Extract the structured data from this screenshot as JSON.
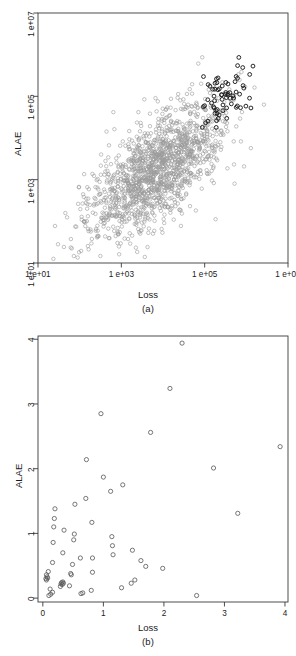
{
  "figure": {
    "panels": [
      {
        "id": "a",
        "caption": "(a)",
        "xlabel": "Loss",
        "ylabel": "ALAE",
        "xticks": [
          "1 e+01",
          "1 e+03",
          "1 e+05",
          "1 e+07"
        ],
        "yticks": [
          "1 e+01",
          "1 e+03",
          "1 e+05",
          "1 e+07"
        ]
      },
      {
        "id": "b",
        "caption": "(b)",
        "xlabel": "Loss",
        "ylabel": "ALAE",
        "xticks": [
          "0",
          "1",
          "2",
          "3",
          "4"
        ],
        "yticks": [
          "0",
          "1",
          "2",
          "3",
          "4"
        ]
      }
    ]
  },
  "colors": {
    "frame": "#3a3a3a",
    "point_light": "#9a9a9a",
    "point_dark": "#1c1c1c",
    "text": "#1a1a1a",
    "background": "#ffffff"
  },
  "chart_data": [
    {
      "type": "scatter",
      "title": "(a)",
      "xlabel": "Loss",
      "ylabel": "ALAE",
      "xscale": "log10",
      "yscale": "log10",
      "xlim": [
        10,
        10000000
      ],
      "ylim": [
        10,
        10000000
      ],
      "xtick_values": [
        10,
        1000,
        100000,
        10000000
      ],
      "xtick_labels": [
        "1 e+01",
        "1 e+03",
        "1 e+05",
        "1 e+07"
      ],
      "ytick_values": [
        10,
        1000,
        100000,
        10000000
      ],
      "ytick_labels": [
        "1 e+01",
        "1 e+03",
        "1 e+05",
        "1 e+07"
      ],
      "grid": false,
      "legend": "none",
      "marker": "open-circle",
      "notes": "Large bulk sample drawn in light gray; an upper-right subset of extreme joint observations drawn in black.",
      "series": [
        {
          "name": "bulk",
          "color": "#9a9a9a",
          "n_points": 1466,
          "log10_x_mean": 3.85,
          "log10_x_sd": 0.82,
          "log10_y_mean": 3.22,
          "log10_y_sd": 0.78,
          "log10_corr": 0.63
        },
        {
          "name": "extreme-subset",
          "color": "#1c1c1c",
          "n_points": 68,
          "log10_x_mean": 5.42,
          "log10_x_sd": 0.36,
          "log10_y_mean": 4.94,
          "log10_y_sd": 0.38,
          "log10_corr": 0.55
        }
      ]
    },
    {
      "type": "scatter",
      "title": "(b)",
      "xlabel": "Loss",
      "ylabel": "ALAE",
      "xscale": "linear",
      "yscale": "linear",
      "xlim": [
        -0.08,
        4.05
      ],
      "ylim": [
        -0.06,
        4.05
      ],
      "xtick_values": [
        0,
        1,
        2,
        3,
        4
      ],
      "xtick_labels": [
        "0",
        "1",
        "2",
        "3",
        "4"
      ],
      "ytick_values": [
        0,
        1,
        2,
        3,
        4
      ],
      "ytick_labels": [
        "0",
        "1",
        "2",
        "3",
        "4"
      ],
      "grid": false,
      "legend": "none",
      "marker": "open-circle",
      "marker_color": "#555555",
      "points": [
        [
          2.3,
          3.94
        ],
        [
          2.1,
          3.24
        ],
        [
          0.96,
          2.85
        ],
        [
          1.78,
          2.56
        ],
        [
          3.92,
          2.34
        ],
        [
          0.72,
          2.14
        ],
        [
          2.82,
          2.01
        ],
        [
          1.0,
          1.87
        ],
        [
          1.32,
          1.75
        ],
        [
          1.12,
          1.65
        ],
        [
          0.71,
          1.54
        ],
        [
          0.53,
          1.45
        ],
        [
          0.2,
          1.38
        ],
        [
          3.22,
          1.31
        ],
        [
          0.19,
          1.23
        ],
        [
          0.81,
          1.17
        ],
        [
          0.18,
          1.1
        ],
        [
          0.35,
          1.05
        ],
        [
          0.52,
          0.99
        ],
        [
          0.51,
          0.9
        ],
        [
          1.14,
          0.95
        ],
        [
          0.17,
          0.86
        ],
        [
          1.15,
          0.81
        ],
        [
          0.33,
          0.7
        ],
        [
          1.48,
          0.74
        ],
        [
          1.16,
          0.67
        ],
        [
          0.82,
          0.62
        ],
        [
          1.62,
          0.58
        ],
        [
          0.16,
          0.55
        ],
        [
          1.7,
          0.49
        ],
        [
          0.49,
          0.52
        ],
        [
          1.98,
          0.46
        ],
        [
          0.82,
          0.4
        ],
        [
          0.46,
          0.38
        ],
        [
          0.06,
          0.36
        ],
        [
          0.09,
          0.41
        ],
        [
          0.05,
          0.3
        ],
        [
          0.06,
          0.28
        ],
        [
          1.52,
          0.28
        ],
        [
          1.46,
          0.23
        ],
        [
          0.3,
          0.22
        ],
        [
          0.31,
          0.24
        ],
        [
          0.32,
          0.21
        ],
        [
          0.44,
          0.19
        ],
        [
          0.29,
          0.18
        ],
        [
          1.3,
          0.16
        ],
        [
          0.12,
          0.14
        ],
        [
          0.8,
          0.12
        ],
        [
          0.63,
          0.07
        ],
        [
          0.13,
          0.06
        ],
        [
          0.16,
          0.09
        ],
        [
          0.1,
          0.04
        ],
        [
          2.54,
          0.04
        ],
        [
          0.34,
          0.23
        ],
        [
          0.33,
          0.25
        ],
        [
          0.07,
          0.33
        ],
        [
          0.08,
          0.31
        ],
        [
          0.62,
          0.62
        ],
        [
          0.47,
          0.36
        ],
        [
          0.66,
          0.08
        ]
      ]
    }
  ]
}
